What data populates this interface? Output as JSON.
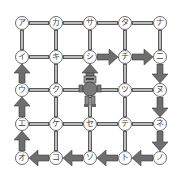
{
  "grid": {
    "columns_x": [
      22,
      56,
      90,
      125,
      160
    ],
    "rows_y": [
      23,
      57,
      90,
      124,
      158
    ],
    "nodes": [
      [
        "ア",
        "カ",
        "サ",
        "タ",
        "ナ"
      ],
      [
        "イ",
        "キ",
        "シ",
        "チ",
        "ニ"
      ],
      [
        "ウ",
        "ク",
        "ス",
        "ツ",
        "ヌ"
      ],
      [
        "エ",
        "ケ",
        "セ",
        "テ",
        "ネ"
      ],
      [
        "オ",
        "コ",
        "ソ",
        "ト",
        "ノ"
      ]
    ],
    "robot_position": {
      "row": 2,
      "col": 2
    },
    "robot_icon": "robot-icon",
    "path_arrows": [
      {
        "from": "ス",
        "to": "シ",
        "dir": "up"
      },
      {
        "from": "シ",
        "to": "チ",
        "dir": "right"
      },
      {
        "from": "チ",
        "to": "ニ",
        "dir": "right"
      },
      {
        "from": "ニ",
        "to": "ヌ",
        "dir": "down"
      },
      {
        "from": "ヌ",
        "to": "ネ",
        "dir": "down"
      },
      {
        "from": "ネ",
        "to": "ノ",
        "dir": "down"
      },
      {
        "from": "ノ",
        "to": "ト",
        "dir": "left"
      },
      {
        "from": "ト",
        "to": "ソ",
        "dir": "left"
      },
      {
        "from": "ソ",
        "to": "コ",
        "dir": "left"
      },
      {
        "from": "コ",
        "to": "オ",
        "dir": "left"
      },
      {
        "from": "オ",
        "to": "エ",
        "dir": "up"
      },
      {
        "from": "エ",
        "to": "ウ",
        "dir": "up"
      },
      {
        "from": "ウ",
        "to": "イ",
        "dir": "up"
      }
    ],
    "colors": {
      "edge_fill": "#bdbdbd",
      "edge_border": "#5a5a5a",
      "arrow_fill": "#6e6e6e",
      "node_border": "#6a6a6a",
      "robot_fill": "#7a7a7a"
    }
  }
}
